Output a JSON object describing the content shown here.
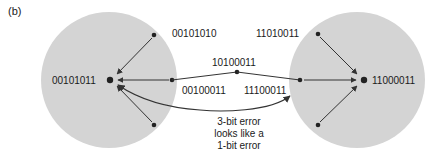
{
  "figure": {
    "panel_label": "(b)",
    "left_cluster": {
      "center_codeword": "00101011",
      "neighbor_top": "00101010",
      "neighbor_right": "00100011"
    },
    "right_cluster": {
      "center_codeword": "11000011",
      "neighbor_top": "11010011",
      "neighbor_left": "11100011"
    },
    "midpoint_codeword": "10100011",
    "annotation": [
      "3-bit error",
      "looks like a",
      "1-bit error"
    ],
    "colors": {
      "circle_fill": "#d4d4d4",
      "line": "#333333",
      "text": "#1a1a1a"
    }
  }
}
